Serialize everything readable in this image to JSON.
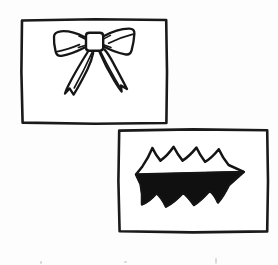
{
  "document": {
    "title": "Scanned line-art drawing",
    "medium": "black ink line art on white paper",
    "background_color": "#fdfdfd",
    "ink_color": "#171717",
    "width": 278,
    "height": 265
  },
  "panels": [
    {
      "id": "panel-bow",
      "name": "upper-left-panel",
      "label": "Bow panel",
      "position": "upper left",
      "frame": {
        "x": 21,
        "y": 19,
        "width": 146,
        "height": 105,
        "stroke_color": "#1a1a1a",
        "stroke_width": 2.6,
        "fill": "#ffffff"
      },
      "figure": {
        "name": "ribbon-bow",
        "description": "Outlined ribbon bow with two loops, a square knot, and two notched tails",
        "style": "outline",
        "fill": "none",
        "stroke_color": "#161616",
        "stroke_width": 2.3,
        "parts": [
          "left-loop",
          "right-loop",
          "center-knot",
          "left-tail",
          "right-tail"
        ],
        "center_x": 94,
        "center_y": 46
      }
    },
    {
      "id": "panel-burst",
      "name": "lower-right-panel",
      "label": "Burst panel",
      "position": "lower right",
      "frame": {
        "x": 118,
        "y": 129,
        "width": 150,
        "height": 103,
        "stroke_color": "#1a1a1a",
        "stroke_width": 2.6,
        "fill": "#ffffff"
      },
      "figure": {
        "name": "scalloped-burst",
        "description": "Horizontal starburst with three rounded peaks on top, pointed left and right tips, and three rounded points below; lower half solid black",
        "style": "half-filled",
        "fill_color": "#101010",
        "fill_region": "lower half",
        "stroke_color": "#141414",
        "stroke_width": 2.4,
        "peaks_top": 3,
        "points_bottom": 3,
        "center_x": 192,
        "center_y": 178
      }
    }
  ],
  "artifacts": {
    "label": "scan specks",
    "color": "#d8d8d8",
    "marks": [
      {
        "x": 40,
        "y": 261,
        "width": 2,
        "height": 3
      },
      {
        "x": 124,
        "y": 261,
        "width": 3,
        "height": 2
      },
      {
        "x": 215,
        "y": 258,
        "width": 2,
        "height": 6
      }
    ]
  }
}
